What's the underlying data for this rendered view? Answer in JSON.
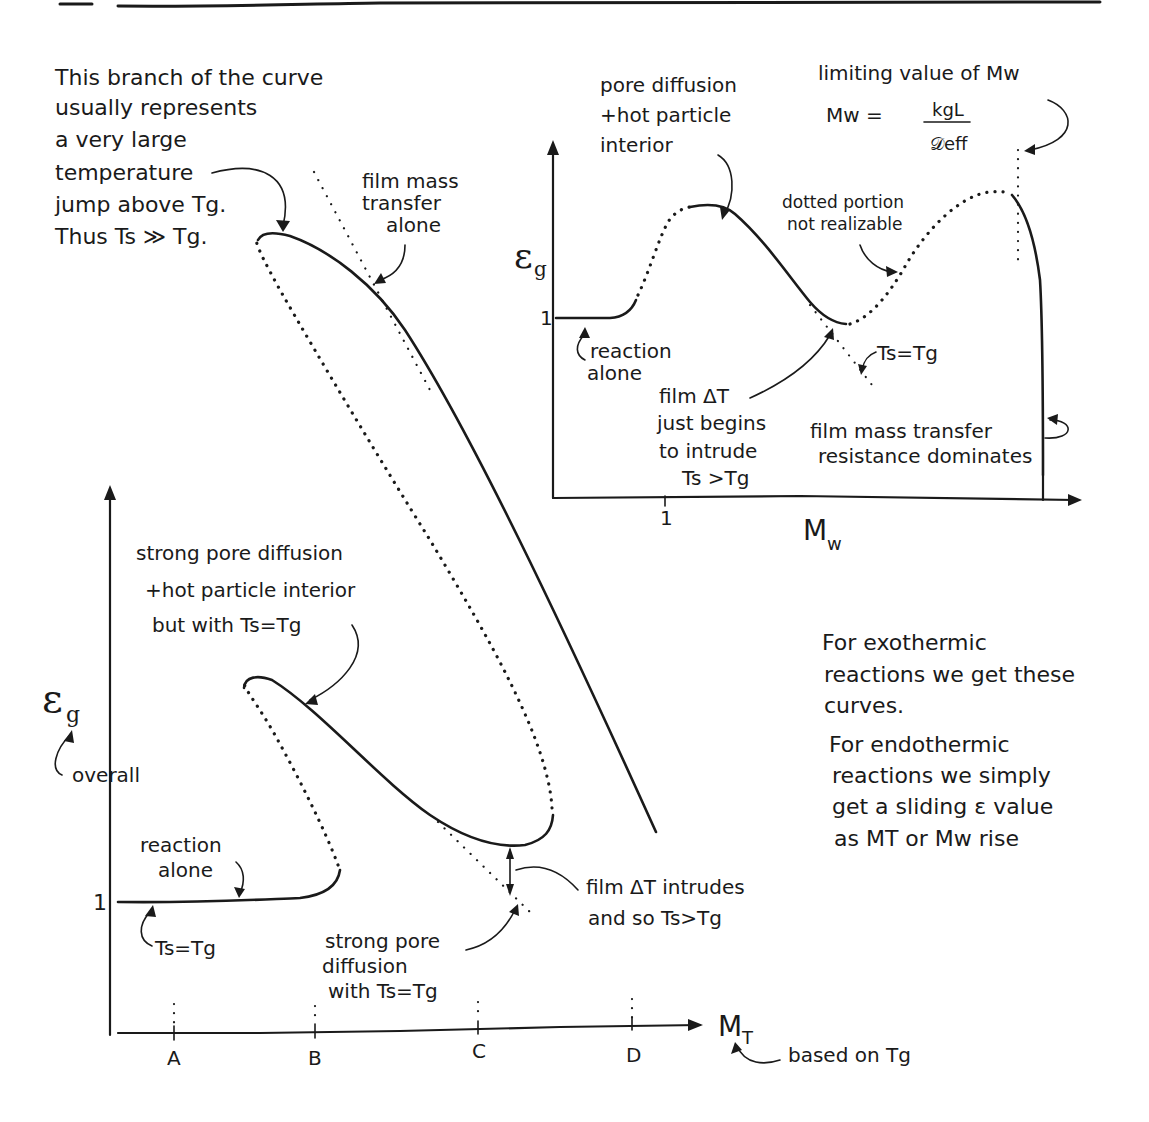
{
  "notes": {
    "top_left_branch": [
      "This branch of the curve",
      "usually represents",
      "a very large",
      "temperature",
      "jump above Tg.",
      "Thus  Ts ≫ Tg."
    ],
    "film_mass_transfer_alone": [
      "film mass",
      "transfer",
      "alone"
    ],
    "exo_endo": [
      "For exothermic",
      "reactions we get these",
      "curves.",
      "For endothermic",
      "reactions we simply",
      "get a sliding ε value",
      "as  MT or Mw rise"
    ]
  },
  "main_chart": {
    "y_axis_label": "εg",
    "y_axis_sub": "overall",
    "y_tick": "1",
    "x_axis_label": "MT",
    "x_axis_note": "based on Tg",
    "x_ticks": [
      "A",
      "B",
      "C",
      "D"
    ],
    "annotations": {
      "strong_pore_hot": [
        "strong pore diffusion",
        "+hot particle interior",
        "but with Ts=Tg"
      ],
      "reaction_alone": [
        "reaction",
        "alone"
      ],
      "ts_eq_tg": "Ts=Tg",
      "strong_pore": [
        "strong pore",
        "diffusion",
        "with Ts=Tg"
      ],
      "film_dt": [
        "film ΔT intrudes",
        "and so Ts>Tg"
      ]
    }
  },
  "inset_chart": {
    "y_axis_label": "εg",
    "y_tick": "1",
    "x_axis_label": "Mw",
    "x_tick": "1",
    "annotations": {
      "pore_hot": [
        "pore diffusion",
        "+hot particle",
        "interior"
      ],
      "limiting": "limiting value of Mw",
      "formula_lhs": "Mw =",
      "formula_num": "kgL",
      "formula_den": "𝒟eff",
      "dotted_portion": [
        "dotted portion",
        "not realizable"
      ],
      "reaction_alone": [
        "reaction",
        "alone"
      ],
      "ts_eq_tg": "Ts=Tg",
      "film_dt": [
        "film ΔT",
        "just begins",
        "to intrude",
        "Ts >Tg"
      ],
      "film_mass": [
        "film mass transfer",
        "resistance dominates"
      ]
    }
  }
}
